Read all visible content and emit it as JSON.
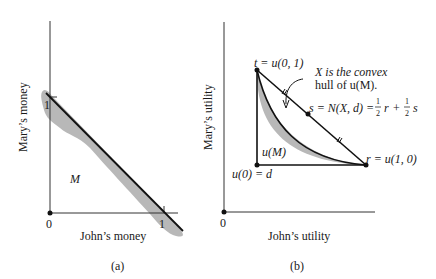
{
  "panel_a": {
    "caption": "(a)",
    "x_axis_label": "John’s money",
    "y_axis_label": "Mary’s money",
    "origin_label": "0",
    "x_tick_label": "1",
    "y_tick_label": "1",
    "region_label": "M"
  },
  "panel_b": {
    "caption": "(b)",
    "x_axis_label": "John’s utility",
    "y_axis_label": "Mary’s utility",
    "origin_label": "0",
    "point_t_label": "t = u(0, 1)",
    "point_r_label": "r = u(1, 0)",
    "point_d_label": "u(0) = d",
    "region_label": "u(M)",
    "annotation_line1": "X is the convex",
    "annotation_line2": "hull of u(M).",
    "point_s_prefix": "s = N(X, d) = ",
    "half": "1",
    "two": "2",
    "r_var": "r",
    "plus": "+",
    "s_var": "s"
  },
  "colors": {
    "ink": "#1a1a1a",
    "shade": "#b8b8b8"
  }
}
